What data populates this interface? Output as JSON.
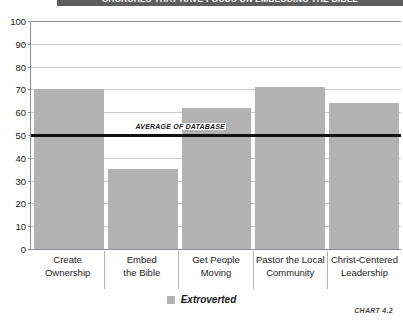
{
  "banner": {
    "title": "CHURCHES THAT HAVE FOCUS ON EMBEDDING THE BIBLE"
  },
  "caption": "CHART 4.2",
  "legend": {
    "position": "bottom-center",
    "swatch_color": "#b2b2b2",
    "entries": [
      {
        "label": "Extroverted"
      }
    ]
  },
  "annotation": {
    "average_label": "AVERAGE OF DATABASE",
    "average_value": 50,
    "line_color": "#111111"
  },
  "colors": {
    "bar": "#b2b2b2",
    "gridline": "#c9c9cf",
    "axis": "#8c8c99",
    "banner_bg": "#5e5e5e",
    "plot_bg": "#ffffff"
  },
  "chart_data": {
    "type": "bar",
    "title": "CHURCHES THAT HAVE FOCUS ON EMBEDDING THE BIBLE",
    "xlabel": "",
    "ylabel": "",
    "ylim": [
      0,
      100
    ],
    "yticks": [
      0,
      10,
      20,
      30,
      40,
      50,
      60,
      70,
      80,
      90,
      100
    ],
    "ytick_labels": [
      "0",
      "10",
      "20",
      "30",
      "40",
      "50",
      "60",
      "70",
      "80",
      "90",
      "100"
    ],
    "grid": true,
    "categories": [
      "Create Ownership",
      "Embed the Bible",
      "Get People Moving",
      "Pastor the Local Community",
      "Christ-Centered Leadership"
    ],
    "category_lines": [
      [
        "Create",
        "Ownership"
      ],
      [
        "Embed",
        "the Bible"
      ],
      [
        "Get People",
        "Moving"
      ],
      [
        "Pastor the Local",
        "Community"
      ],
      [
        "Christ-Centered",
        "Leadership"
      ]
    ],
    "series": [
      {
        "name": "Extroverted",
        "color": "#b2b2b2",
        "values": [
          70,
          35,
          62,
          71,
          64
        ]
      }
    ],
    "reference_line": {
      "label": "AVERAGE OF DATABASE",
      "value": 50
    }
  }
}
